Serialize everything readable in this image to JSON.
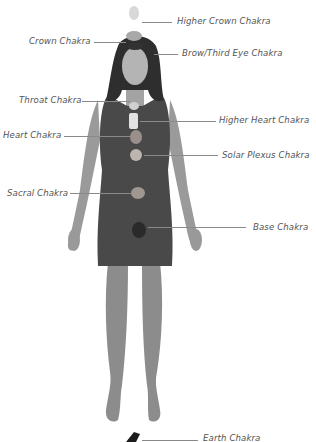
{
  "diagram": {
    "figure": "person lying with crystals placed on chakra points",
    "colors": {
      "dress": "#4a4a4a",
      "skin": "#9a9a9a",
      "hair": "#2e2e2e",
      "label_text": "#555555",
      "leader_line": "#8a8a8a",
      "background": "#ffffff"
    },
    "labels": [
      {
        "id": "higher-crown",
        "text": "Higher Crown Chakra",
        "side": "right"
      },
      {
        "id": "crown",
        "text": "Crown Chakra",
        "side": "left"
      },
      {
        "id": "brow",
        "text": "Brow/Third Eye Chakra",
        "side": "right"
      },
      {
        "id": "throat",
        "text": "Throat Chakra",
        "side": "left"
      },
      {
        "id": "higher-heart",
        "text": "Higher Heart Chakra",
        "side": "right"
      },
      {
        "id": "heart",
        "text": "Heart Chakra",
        "side": "left"
      },
      {
        "id": "solar-plexus",
        "text": "Solar Plexus Chakra",
        "side": "right"
      },
      {
        "id": "sacral",
        "text": "Sacral Chakra",
        "side": "left"
      },
      {
        "id": "base",
        "text": "Base Chakra",
        "side": "right"
      },
      {
        "id": "earth",
        "text": "Earth Chakra",
        "side": "right"
      }
    ]
  }
}
